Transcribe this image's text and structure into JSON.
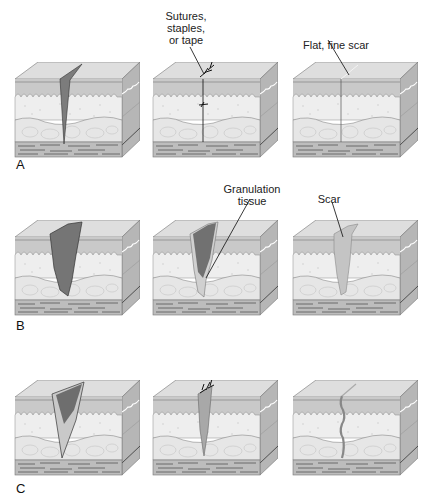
{
  "figure": {
    "rows": [
      {
        "letter": "A",
        "panels": [
          {
            "stage": "wound",
            "wound_type": "clean-incision"
          },
          {
            "stage": "closed",
            "label": "Sutures,\nstaples,\nor tape",
            "label_lines": [
              "Sutures,",
              "staples,",
              "or tape"
            ]
          },
          {
            "stage": "healed",
            "label": "Flat, fine scar"
          }
        ]
      },
      {
        "letter": "B",
        "panels": [
          {
            "stage": "wound",
            "wound_type": "open-gaping"
          },
          {
            "stage": "filling",
            "label_lines": [
              "Granulation",
              "tissue"
            ]
          },
          {
            "stage": "healed",
            "label": "Scar"
          }
        ]
      },
      {
        "letter": "C",
        "panels": [
          {
            "stage": "wound",
            "wound_type": "open-with-granulation"
          },
          {
            "stage": "delayed-closure",
            "wound_type": "sutured"
          },
          {
            "stage": "healed",
            "wound_type": "scar"
          }
        ]
      }
    ],
    "colors": {
      "top_face": "#dcdcdc",
      "epidermis": "#c6c6c6",
      "dermis": "#ececec",
      "subcut": "#e4e4e4",
      "muscle": "#b8b8b8",
      "side_face": "#b4b4b4",
      "wound_dark": "#7a7a7a",
      "granulation": "#c8c8c8",
      "line": "#555555"
    }
  }
}
